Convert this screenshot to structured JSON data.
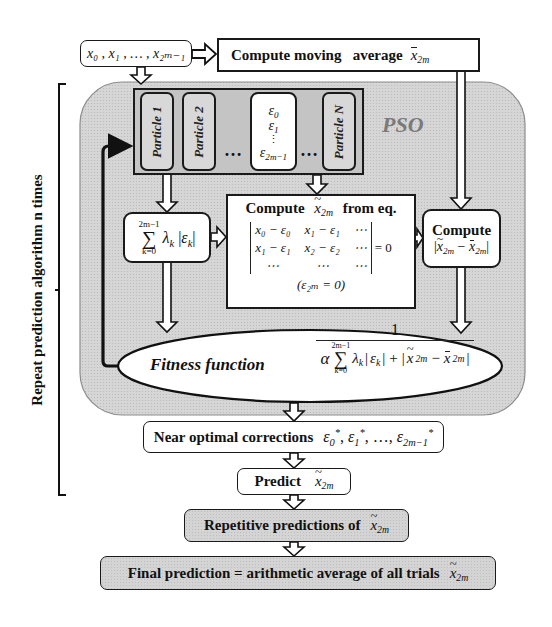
{
  "input_box": {
    "label": "x₀ , x₁ , … , x₂ₘ₋₁",
    "parts": [
      "x",
      "0",
      "x",
      "1",
      "x",
      "2m−1"
    ]
  },
  "moving_average": {
    "label": "Compute moving   average",
    "symbol": "x",
    "sub": "2m"
  },
  "pso": {
    "label": "PSO",
    "particles": [
      "Particle 1",
      "Particle 2",
      "Particle N"
    ],
    "dots": "…",
    "epsilon_column": {
      "items": [
        "ε",
        "ε",
        "⋮",
        "ε"
      ],
      "subs": [
        "0",
        "1",
        "",
        "2m−1"
      ]
    }
  },
  "sum_box": {
    "upper": "2m−1",
    "sigma": "∑",
    "lower": "k=0",
    "body": "λ",
    "body_sub": "k",
    "eps": "ε",
    "eps_sub": "k"
  },
  "equation_box": {
    "title_left": "Compute",
    "title_symbol": "x",
    "title_sub": "2m",
    "title_right": "from eq.",
    "matrix": [
      [
        "x₀ − ε₀",
        "x₁ − ε₁",
        "⋯"
      ],
      [
        "x₁ − ε₁",
        "x₂ − ε₂",
        "⋯"
      ],
      [
        "⋯",
        "⋯",
        "⋯"
      ]
    ],
    "equals": "= 0",
    "note": "(ε₂ₘ = 0)"
  },
  "compute_diff_box": {
    "title": "Compute",
    "expr_sub": "2m",
    "minus": "−"
  },
  "fitness": {
    "label": "Fitness function",
    "numerator": "1",
    "alpha": "α",
    "sigma": "∑",
    "upper": "2m−1",
    "lower": "k=0",
    "body": "λ",
    "body_sub": "k",
    "eps": "ε",
    "eps_sub": "k",
    "plus": "+",
    "sub": "2m",
    "minus": "−"
  },
  "near_optimal": {
    "label": "Near optimal corrections",
    "expr": [
      "ε",
      "0",
      "ε",
      "1",
      "ε",
      "2m−1"
    ],
    "star": "*",
    "sep": ",",
    "ellipsis": "…,"
  },
  "predict": {
    "label": "Predict",
    "symbol": "x",
    "sub": "2m"
  },
  "repetitive": {
    "label": "Repetitive predictions of",
    "symbol": "x",
    "sub": "2m"
  },
  "final": {
    "label": "Final prediction = arithmetic average of all trials",
    "symbol": "x",
    "sub": "2m"
  },
  "bracket_label": "Repeat prediction algorithm n times",
  "colors": {
    "region_gray": "#d4d4d4",
    "stroke": "#1a1a1a",
    "pso_label": "#7a7a7a",
    "strip_gray": "#bfbfbf"
  }
}
